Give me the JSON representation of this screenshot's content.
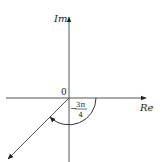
{
  "diagram": {
    "type": "complex-plane-angle",
    "axes": {
      "x_label": "Re",
      "y_label": "Im",
      "origin_label": "0"
    },
    "angle": {
      "sign": "−",
      "numerator": "3π",
      "denominator": "4",
      "direction": "clockwise"
    },
    "colors": {
      "axis": "#555555",
      "text": "#222222",
      "background": "#ffffff"
    }
  }
}
